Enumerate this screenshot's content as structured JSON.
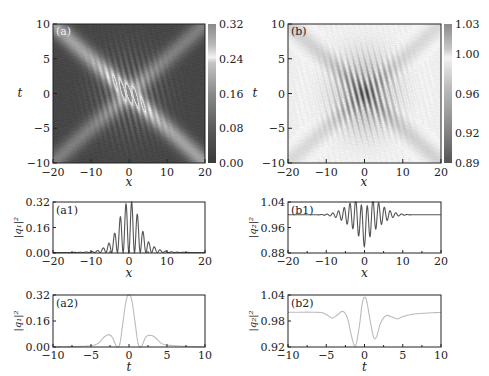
{
  "chart_data": [
    {
      "id": "a",
      "type": "heatmap",
      "panel_label": "(a)",
      "xlabel": "x",
      "ylabel": "t",
      "xlim": [
        -20,
        20
      ],
      "ylim": [
        -10,
        10
      ],
      "xticks": [
        "−20",
        "−10",
        "0",
        "10",
        "20"
      ],
      "xtick_values": [
        -20,
        -10,
        0,
        10,
        20
      ],
      "yticks": [
        "10",
        "5",
        "0",
        "−5",
        "−10"
      ],
      "ytick_values": [
        10,
        5,
        0,
        -5,
        -10
      ],
      "colorbar": {
        "range": [
          0.0,
          0.32
        ],
        "ticks": [
          "0.32",
          "0.24",
          "0.16",
          "0.08",
          "0.00"
        ],
        "tick_values": [
          0.32,
          0.24,
          0.16,
          0.08,
          0.0
        ]
      },
      "description": "Two crossing bright beams (along t = -x/2 and t = x/2); interference fringes near origin with peak |q1|^2 about 0.32; background about 0.02",
      "field": "q1",
      "background_value": 0.02,
      "peak_value": 0.32
    },
    {
      "id": "b",
      "type": "heatmap",
      "panel_label": "(b)",
      "xlabel": "x",
      "ylabel": "t",
      "xlim": [
        -20,
        20
      ],
      "ylim": [
        -10,
        10
      ],
      "xticks": [
        "−20",
        "−10",
        "0",
        "10",
        "20"
      ],
      "xtick_values": [
        -20,
        -10,
        0,
        10,
        20
      ],
      "yticks": [
        "10",
        "5",
        "0",
        "−5",
        "−10"
      ],
      "ytick_values": [
        10,
        5,
        0,
        -5,
        -10
      ],
      "colorbar": {
        "range": [
          0.89,
          1.03
        ],
        "ticks": [
          "1.03",
          "1.00",
          "0.96",
          "0.92",
          "0.89"
        ],
        "tick_values": [
          1.03,
          1.0,
          0.96,
          0.92,
          0.89
        ]
      },
      "description": "Near-uniform background about 1.0 with two dark crossing beams and fringe pattern near origin; minimum about 0.89",
      "field": "q2",
      "background_value": 1.0,
      "min_value": 0.89
    },
    {
      "id": "a1",
      "type": "line",
      "panel_label": "(a1)",
      "xlabel": "x",
      "ylabel": "|q₁|²",
      "xlim": [
        -20,
        20
      ],
      "ylim": [
        0.0,
        0.32
      ],
      "xticks": [
        "−20",
        "−10",
        "0",
        "10",
        "20"
      ],
      "xtick_values": [
        -20,
        -10,
        0,
        10,
        20
      ],
      "yticks": [
        "0.32",
        "0.16",
        "0.00"
      ],
      "ytick_values": [
        0.32,
        0.16,
        0.0
      ],
      "series": [
        {
          "name": "|q1|^2 at t=0",
          "color": "#555555",
          "peaks": [
            {
              "x": -8.3,
              "y": 0.012
            },
            {
              "x": -6.7,
              "y": 0.03
            },
            {
              "x": -5.2,
              "y": 0.06
            },
            {
              "x": -3.7,
              "y": 0.125
            },
            {
              "x": -2.2,
              "y": 0.23
            },
            {
              "x": -0.7,
              "y": 0.31
            },
            {
              "x": 0.7,
              "y": 0.32
            },
            {
              "x": 2.2,
              "y": 0.24
            },
            {
              "x": 3.7,
              "y": 0.13
            },
            {
              "x": 5.2,
              "y": 0.065
            },
            {
              "x": 6.7,
              "y": 0.035
            },
            {
              "x": 8.3,
              "y": 0.015
            }
          ],
          "period": 1.5,
          "baseline": 0.003
        }
      ]
    },
    {
      "id": "b1",
      "type": "line",
      "panel_label": "(b1)",
      "xlabel": "x",
      "ylabel": "|q₂|²",
      "xlim": [
        -20,
        20
      ],
      "ylim": [
        0.88,
        1.04
      ],
      "xticks": [
        "−20",
        "−10",
        "0",
        "10",
        "20"
      ],
      "xtick_values": [
        -20,
        -10,
        0,
        10,
        20
      ],
      "yticks": [
        "1.04",
        "0.96",
        "0.88"
      ],
      "ytick_values": [
        1.04,
        0.96,
        0.88
      ],
      "series": [
        {
          "name": "|q2|^2 at t=0",
          "color": "#555555",
          "baseline": 1.0,
          "oscillation": [
            {
              "x": -0.05,
              "y": 0.88
            },
            {
              "x": -0.7,
              "y": 1.04
            },
            {
              "x": 0.7,
              "y": 1.04
            },
            {
              "x": -1.5,
              "y": 0.905
            },
            {
              "x": 1.5,
              "y": 0.905
            },
            {
              "x": -2.2,
              "y": 1.035
            },
            {
              "x": 2.2,
              "y": 1.035
            },
            {
              "x": -3.0,
              "y": 0.93
            },
            {
              "x": 3.0,
              "y": 0.93
            }
          ],
          "period": 1.5
        }
      ]
    },
    {
      "id": "a2",
      "type": "line",
      "panel_label": "(a2)",
      "xlabel": "t",
      "ylabel": "|q₁|²",
      "xlim": [
        -10,
        10
      ],
      "ylim": [
        0.0,
        0.32
      ],
      "xticks": [
        "−10",
        "−5",
        "0",
        "5",
        "10"
      ],
      "xtick_values": [
        -10,
        -5,
        0,
        5,
        10
      ],
      "yticks": [
        "0.32",
        "0.16",
        "0.00"
      ],
      "ytick_values": [
        0.32,
        0.16,
        0.0
      ],
      "series": [
        {
          "name": "|q1|^2 at x=0",
          "color": "#bbbbbb",
          "points": [
            [
              -10,
              0.0
            ],
            [
              -7,
              0.003
            ],
            [
              -5,
              0.008
            ],
            [
              -4,
              0.025
            ],
            [
              -3.3,
              0.06
            ],
            [
              -2.7,
              0.075
            ],
            [
              -2.2,
              0.06
            ],
            [
              -1.6,
              0.0
            ],
            [
              -1.2,
              0.02
            ],
            [
              -0.8,
              0.15
            ],
            [
              -0.4,
              0.28
            ],
            [
              0,
              0.33
            ],
            [
              0.4,
              0.28
            ],
            [
              0.8,
              0.15
            ],
            [
              1.2,
              0.02
            ],
            [
              1.6,
              0.0
            ],
            [
              2.2,
              0.06
            ],
            [
              2.8,
              0.072
            ],
            [
              3.4,
              0.06
            ],
            [
              4.2,
              0.025
            ],
            [
              5,
              0.012
            ],
            [
              7,
              0.005
            ],
            [
              10,
              0.0
            ]
          ]
        }
      ]
    },
    {
      "id": "b2",
      "type": "line",
      "panel_label": "(b2)",
      "xlabel": "t",
      "ylabel": "|q₂|²",
      "xlim": [
        -10,
        10
      ],
      "ylim": [
        0.92,
        1.04
      ],
      "xticks": [
        "−10",
        "−5",
        "0",
        "5",
        "10"
      ],
      "xtick_values": [
        -10,
        -5,
        0,
        5,
        10
      ],
      "yticks": [
        "1.04",
        "0.98",
        "0.92"
      ],
      "ytick_values": [
        1.04,
        0.98,
        0.92
      ],
      "series": [
        {
          "name": "|q2|^2 at x=0",
          "color": "#bbbbbb",
          "points": [
            [
              -10,
              1.0
            ],
            [
              -6,
              1.0
            ],
            [
              -5,
              0.995
            ],
            [
              -4.2,
              0.987
            ],
            [
              -3.5,
              0.995
            ],
            [
              -2.8,
              1.002
            ],
            [
              -2.2,
              0.985
            ],
            [
              -1.7,
              0.945
            ],
            [
              -1.2,
              0.922
            ],
            [
              -0.7,
              0.965
            ],
            [
              -0.3,
              1.02
            ],
            [
              0,
              1.035
            ],
            [
              0.3,
              1.025
            ],
            [
              0.7,
              0.985
            ],
            [
              1.2,
              0.942
            ],
            [
              1.6,
              0.945
            ],
            [
              2.1,
              0.975
            ],
            [
              2.8,
              0.992
            ],
            [
              3.5,
              0.99
            ],
            [
              4.3,
              0.985
            ],
            [
              5,
              0.99
            ],
            [
              6.5,
              0.996
            ],
            [
              10,
              1.0
            ]
          ]
        }
      ]
    }
  ]
}
